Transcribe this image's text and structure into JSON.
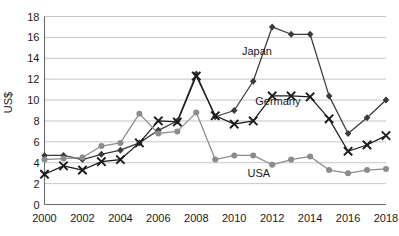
{
  "chart_data": {
    "type": "line",
    "title": "",
    "xlabel": "",
    "ylabel": "US$",
    "xlim": [
      2000,
      2018
    ],
    "ylim": [
      0,
      18
    ],
    "ytick_step": 2,
    "xtick_step": 2,
    "grid": true,
    "legend_position": "inline-annotations",
    "x": [
      2000,
      2001,
      2002,
      2003,
      2004,
      2005,
      2006,
      2007,
      2008,
      2009,
      2010,
      2011,
      2012,
      2013,
      2014,
      2015,
      2016,
      2017,
      2018
    ],
    "xtick_labels": [
      "2000",
      "2002",
      "2004",
      "2006",
      "2008",
      "2010",
      "2012",
      "2014",
      "2016",
      "2018"
    ],
    "ytick_labels": [
      "0",
      "2",
      "4",
      "6",
      "8",
      "10",
      "12",
      "14",
      "16",
      "18"
    ],
    "series": [
      {
        "name": "Japan",
        "marker": "diamond",
        "color": "#3a3a3a",
        "label_x": 2011.2,
        "label_y": 14.3,
        "values": [
          4.7,
          4.7,
          4.3,
          4.8,
          5.2,
          5.9,
          7.1,
          8.0,
          12.5,
          8.4,
          9.0,
          11.8,
          17.0,
          16.3,
          16.3,
          10.4,
          6.8,
          8.3,
          10.0
        ]
      },
      {
        "name": "Germany",
        "marker": "x",
        "color": "#1a1a1a",
        "label_x": 2012.3,
        "label_y": 9.5,
        "values": [
          2.9,
          3.7,
          3.3,
          4.1,
          4.3,
          5.9,
          8.0,
          7.9,
          12.3,
          8.5,
          7.7,
          8.0,
          10.4,
          10.4,
          10.3,
          8.2,
          5.1,
          5.7,
          6.6
        ]
      },
      {
        "name": "USA",
        "marker": "circle",
        "color": "#8c8c8c",
        "label_x": 2011.3,
        "label_y": 2.6,
        "values": [
          4.3,
          4.4,
          4.5,
          5.6,
          5.9,
          8.7,
          6.8,
          7.0,
          8.8,
          4.3,
          4.7,
          4.7,
          3.8,
          4.3,
          4.6,
          3.3,
          3.0,
          3.3,
          3.4
        ]
      }
    ]
  }
}
